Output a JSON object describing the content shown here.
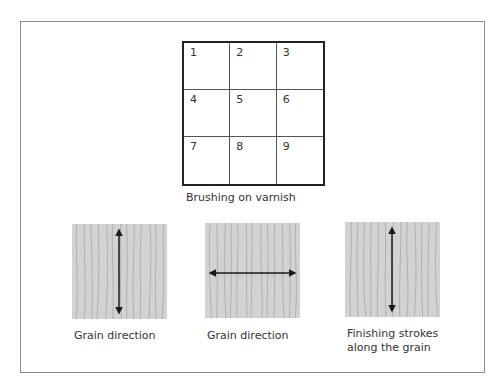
{
  "grid": {
    "cells": [
      "1",
      "2",
      "3",
      "4",
      "5",
      "6",
      "7",
      "8",
      "9"
    ],
    "caption": "Brushing on varnish"
  },
  "panels": [
    {
      "arrow_direction": "vertical",
      "caption_line1": "Grain direction",
      "caption_line2": ""
    },
    {
      "arrow_direction": "horizontal",
      "caption_line1": "Grain direction",
      "caption_line2": ""
    },
    {
      "arrow_direction": "vertical",
      "caption_line1": "Finishing strokes",
      "caption_line2": "along the grain"
    }
  ],
  "colors": {
    "wood_fill": "#d2d2d2",
    "grain_line": "#9a9a9a",
    "arrow": "#1a1a1a"
  }
}
